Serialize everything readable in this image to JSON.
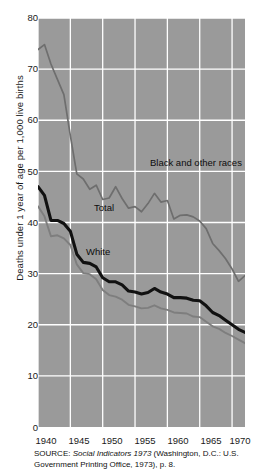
{
  "chart_data": {
    "type": "line",
    "title": "",
    "subtitle": "",
    "xlabel": "",
    "ylabel": "Deaths under 1 year of age per 1,000 live births",
    "xlim": [
      1940,
      1972
    ],
    "ylim": [
      0,
      80
    ],
    "grid": true,
    "legend_position": "inline-annotations",
    "xticks": [
      1940,
      1945,
      1950,
      1955,
      1960,
      1965,
      1970
    ],
    "yticks": [
      0,
      10,
      20,
      30,
      40,
      50,
      60,
      70,
      80
    ],
    "x": [
      1940,
      1941,
      1942,
      1943,
      1944,
      1945,
      1946,
      1947,
      1948,
      1949,
      1950,
      1951,
      1952,
      1953,
      1954,
      1955,
      1956,
      1957,
      1958,
      1959,
      1960,
      1961,
      1962,
      1963,
      1964,
      1965,
      1966,
      1967,
      1968,
      1969,
      1970,
      1971,
      1972
    ],
    "series": [
      {
        "name": "Black and other races",
        "color": "#6e6e6e",
        "width": 1.7,
        "values": [
          73.8,
          74.8,
          71.0,
          68.0,
          65.0,
          57.0,
          49.5,
          48.5,
          46.5,
          47.3,
          44.5,
          44.8,
          47.0,
          44.7,
          42.8,
          43.1,
          42.1,
          43.7,
          45.7,
          44.0,
          44.3,
          40.7,
          41.4,
          41.5,
          41.1,
          40.3,
          38.8,
          35.9,
          34.5,
          32.9,
          30.9,
          28.5,
          29.6
        ]
      },
      {
        "name": "Total",
        "color": "#111111",
        "width": 3.1,
        "values": [
          47.0,
          45.3,
          40.4,
          40.4,
          39.8,
          38.3,
          33.8,
          32.2,
          32.0,
          31.3,
          29.2,
          28.4,
          28.4,
          27.8,
          26.6,
          26.4,
          26.0,
          26.3,
          27.1,
          26.4,
          26.0,
          25.3,
          25.3,
          25.2,
          24.8,
          24.7,
          23.7,
          22.4,
          21.8,
          20.9,
          20.0,
          19.1,
          18.5
        ]
      },
      {
        "name": "White",
        "color": "#7e7e7e",
        "width": 1.9,
        "values": [
          43.2,
          41.2,
          37.3,
          37.5,
          36.9,
          35.6,
          31.8,
          30.1,
          29.9,
          28.9,
          26.8,
          25.8,
          25.5,
          24.9,
          23.9,
          23.6,
          23.2,
          23.3,
          23.8,
          23.2,
          22.9,
          22.4,
          22.3,
          22.2,
          21.6,
          21.5,
          20.6,
          19.7,
          19.2,
          18.4,
          17.8,
          17.1,
          16.4
        ]
      }
    ],
    "annotations": [
      {
        "text": "Black and other races",
        "series": "Black and other races"
      },
      {
        "text": "Total",
        "series": "Total"
      },
      {
        "text": "White",
        "series": "White"
      }
    ],
    "colors": {
      "plot_background": "#9a9a9a",
      "gridline": "#ffffff",
      "axis": "#1a1a1a",
      "page_background": "#ffffff"
    }
  },
  "axes": {
    "y_title": "Deaths under 1 year of age per 1,000 live births",
    "y_tick_labels": [
      "80",
      "70",
      "60",
      "50",
      "40",
      "30",
      "20",
      "10",
      "0"
    ],
    "x_tick_labels": [
      "1940",
      "1945",
      "1950",
      "1955",
      "1960",
      "1965",
      "1970"
    ]
  },
  "annotations": {
    "black_and_other_races": "Black and other races",
    "total": "Total",
    "white": "White"
  },
  "source": {
    "prefix": "SOURCE: ",
    "italic_title": "Social Indicators 1973",
    "rest": " (Washington, D.C.: U.S. Government Printing Office, 1973), p. 8."
  }
}
